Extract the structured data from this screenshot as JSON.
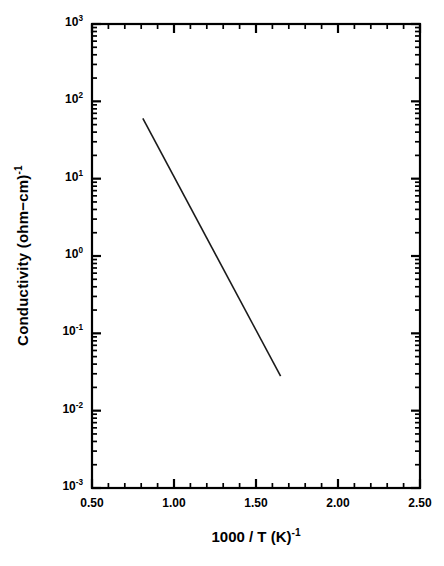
{
  "chart_data": {
    "type": "line",
    "title": "",
    "subtitle": "",
    "xlabel": "1000 / T (K)",
    "xlabel_sup": "-1",
    "ylabel": "Conductivity (ohm−cm)",
    "ylabel_sup": "-1",
    "xscale": "linear",
    "yscale": "log",
    "xlim": [
      0.5,
      2.5
    ],
    "ylim": [
      0.001,
      1000
    ],
    "grid": false,
    "legend": null,
    "legend_position": "none",
    "x_major_ticks": [
      0.5,
      1.0,
      1.5,
      2.0,
      2.5
    ],
    "x_tick_labels": [
      "0.50",
      "1.00",
      "1.50",
      "2.00",
      "2.50"
    ],
    "x_minor_per_interval": 4,
    "y_major_ticks": [
      0.001,
      0.01,
      0.1,
      1,
      10,
      100,
      1000
    ],
    "y_tick_labels": [
      {
        "mantissa": "10",
        "exponent": "-3"
      },
      {
        "mantissa": "10",
        "exponent": "-2"
      },
      {
        "mantissa": "10",
        "exponent": "-1"
      },
      {
        "mantissa": "10",
        "exponent": "0"
      },
      {
        "mantissa": "10",
        "exponent": "1"
      },
      {
        "mantissa": "10",
        "exponent": "2"
      },
      {
        "mantissa": "10",
        "exponent": "3"
      }
    ],
    "series": [
      {
        "name": "conductivity",
        "color": "#1a1a1a",
        "linewidth": 1.6,
        "x": [
          0.81,
          1.65
        ],
        "y": [
          60.0,
          0.028
        ],
        "points": [
          {
            "x": 0.81,
            "y": 60.0
          },
          {
            "x": 1.65,
            "y": 0.028
          }
        ]
      }
    ],
    "annotations": []
  },
  "axes": {
    "frame_color": "#000000",
    "tick_direction": "in",
    "spines": [
      "left",
      "right",
      "top",
      "bottom"
    ]
  }
}
